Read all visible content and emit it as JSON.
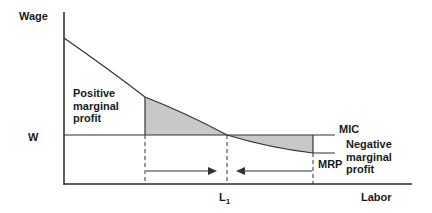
{
  "diagram": {
    "type": "economics-marginal-revenue-product-of-labor",
    "axes": {
      "y_label": "Wage",
      "x_label": "Labor"
    },
    "wage_level_label": "W",
    "equilibrium_label": "L",
    "equilibrium_subscript": "1",
    "curves": {
      "mic_label": "MIC",
      "mrp_label": "MRP"
    },
    "regions": {
      "positive": [
        "Positive",
        "marginal",
        "profit"
      ],
      "negative": [
        "Negative",
        "marginal",
        "profit"
      ]
    },
    "colors": {
      "axis": "#2a2a2a",
      "curve": "#333333",
      "shade": "#c8c8c8",
      "text": "#1a1a1a"
    }
  }
}
